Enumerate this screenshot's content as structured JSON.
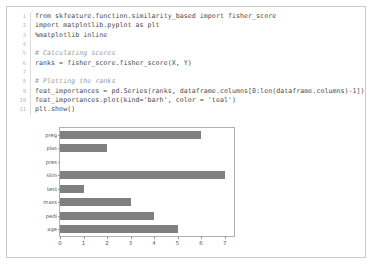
{
  "notebook": {
    "code_cell": {
      "lines": [
        {
          "n": "1",
          "text": "from skfeature.function.similarity_based import fisher_score",
          "comment": false
        },
        {
          "n": "2",
          "text": "import matplotlib.pyplot as plt",
          "comment": false
        },
        {
          "n": "3",
          "text": "%matplotlib inline",
          "comment": false
        },
        {
          "n": "4",
          "text": "",
          "comment": false
        },
        {
          "n": "5",
          "text": "# Calculating scores",
          "comment": true
        },
        {
          "n": "6",
          "text": "ranks = fisher_score.fisher_score(X, Y)",
          "comment": false
        },
        {
          "n": "7",
          "text": "",
          "comment": false
        },
        {
          "n": "8",
          "text": "# Plotting the ranks",
          "comment": true
        },
        {
          "n": "9",
          "text": "feat_importances = pd.Series(ranks, dataframe.columns[0:len(dataframe.columns)-1])",
          "comment": false
        },
        {
          "n": "10",
          "text": "feat_importances.plot(kind='barh', color = 'teal')",
          "comment": false
        },
        {
          "n": "11",
          "text": "plt.show()",
          "comment": false
        }
      ]
    }
  },
  "chart_data": {
    "type": "bar",
    "orientation": "horizontal",
    "title": "",
    "xlabel": "",
    "ylabel": "",
    "categories": [
      "age",
      "pedi",
      "mass",
      "test",
      "skin",
      "pres",
      "plas",
      "preg"
    ],
    "values": [
      5,
      4,
      3,
      1,
      7,
      0,
      2,
      6
    ],
    "xlim": [
      0,
      7.4
    ],
    "xticks": [
      0,
      1,
      2,
      3,
      4,
      5,
      6,
      7
    ],
    "xtick_labels": [
      "0",
      "1",
      "2",
      "3",
      "4",
      "5",
      "6",
      "7"
    ],
    "grid": false,
    "legend": false,
    "bar_color": "#808080",
    "requested_color": "teal"
  }
}
